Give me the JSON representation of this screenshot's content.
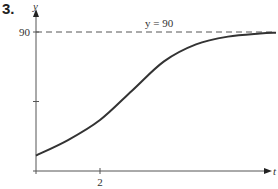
{
  "problem_number": "3.",
  "chart_data": {
    "type": "line",
    "title": "",
    "xlabel": "t",
    "ylabel": "y",
    "x_ticks": [
      {
        "value": 2,
        "label": "2"
      }
    ],
    "y_ticks": [
      {
        "value": 45,
        "label": ""
      },
      {
        "value": 90,
        "label": "90"
      }
    ],
    "asymptote": {
      "y": 90,
      "label": "y = 90",
      "style": "dashed"
    },
    "xlim": [
      0,
      7.5
    ],
    "ylim": [
      0,
      90
    ],
    "grid": false,
    "legend": null,
    "series": [
      {
        "name": "y(t)",
        "x": [
          0,
          1,
          2,
          3,
          4,
          5,
          6,
          7,
          7.5
        ],
        "y": [
          10,
          20,
          33,
          52,
          71,
          82,
          87,
          89,
          89.5
        ]
      }
    ]
  }
}
